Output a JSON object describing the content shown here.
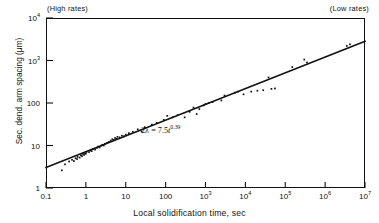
{
  "annotations": {
    "high_rates": "(High rates)",
    "low_rates": "(Low rates)",
    "equation_lhs": "2λ",
    "equation_eq": "=",
    "equation_coeff": "7.5",
    "equation_var": "t",
    "equation_exp": "0.39"
  },
  "chart_data": {
    "type": "scatter",
    "title": "",
    "xlabel": "Local solidification time, sec",
    "ylabel": "Sec. dend. arm spacing  (μm)",
    "xscale": "log",
    "yscale": "log",
    "xlim": [
      0.1,
      10000000
    ],
    "ylim": [
      1,
      10000
    ],
    "grid": false,
    "legend": null,
    "xticks": [
      0.1,
      1,
      10,
      100,
      1000,
      10000,
      100000,
      1000000,
      10000000
    ],
    "xtick_labels": [
      "0.1",
      "1",
      "10",
      "100",
      "10³",
      "10⁴",
      "10⁵",
      "10⁶",
      "10⁷"
    ],
    "yticks": [
      1,
      10,
      100,
      1000,
      10000
    ],
    "ytick_labels": [
      "1",
      "10",
      "100",
      "10³",
      "10⁴"
    ],
    "fit_line": {
      "label": "2λ = 7.5t^0.39",
      "coefficient": 7.5,
      "exponent": 0.39,
      "x_start": 0.1,
      "y_start": 3.05,
      "x_end": 10000000,
      "y_end": 2820
    },
    "points": [
      [
        0.25,
        2.6
      ],
      [
        0.3,
        3.6
      ],
      [
        0.38,
        4.2
      ],
      [
        0.45,
        4.6
      ],
      [
        0.5,
        4.3
      ],
      [
        0.55,
        5.0
      ],
      [
        0.6,
        4.8
      ],
      [
        0.62,
        5.4
      ],
      [
        0.7,
        5.2
      ],
      [
        0.75,
        5.9
      ],
      [
        0.8,
        5.6
      ],
      [
        0.85,
        6.3
      ],
      [
        0.9,
        6.0
      ],
      [
        0.95,
        6.6
      ],
      [
        1.0,
        6.4
      ],
      [
        1.05,
        7.1
      ],
      [
        1.2,
        7.0
      ],
      [
        1.3,
        7.6
      ],
      [
        1.4,
        7.4
      ],
      [
        1.5,
        8.2
      ],
      [
        1.7,
        8.0
      ],
      [
        1.9,
        8.8
      ],
      [
        2.0,
        9.4
      ],
      [
        2.2,
        9.0
      ],
      [
        2.4,
        9.9
      ],
      [
        2.6,
        10.4
      ],
      [
        2.8,
        10.0
      ],
      [
        3.0,
        11.0
      ],
      [
        3.4,
        11.6
      ],
      [
        3.8,
        12.2
      ],
      [
        4.2,
        13.0
      ],
      [
        4.6,
        14.0
      ],
      [
        5.0,
        13.5
      ],
      [
        5.4,
        15.0
      ],
      [
        5.8,
        14.4
      ],
      [
        6.2,
        16.0
      ],
      [
        7.0,
        15.5
      ],
      [
        8.0,
        17.0
      ],
      [
        9.0,
        16.5
      ],
      [
        10.0,
        18.0
      ],
      [
        12.0,
        19.5
      ],
      [
        15.0,
        21.0
      ],
      [
        20.0,
        24.0
      ],
      [
        25.0,
        21.5
      ],
      [
        30.0,
        27.0
      ],
      [
        45.0,
        31.0
      ],
      [
        60.0,
        34.0
      ],
      [
        90.0,
        40.0
      ],
      [
        110.0,
        50.0
      ],
      [
        150.0,
        46.0
      ],
      [
        200.0,
        52.0
      ],
      [
        300.0,
        46.0
      ],
      [
        400.0,
        62.0
      ],
      [
        500.0,
        78.0
      ],
      [
        600.0,
        55.0
      ],
      [
        700.0,
        72.0
      ],
      [
        900.0,
        88.0
      ],
      [
        1000.0,
        95.0
      ],
      [
        1200.0,
        100.0
      ],
      [
        1500.0,
        105.0
      ],
      [
        2500.0,
        115.0
      ],
      [
        3000.0,
        150.0
      ],
      [
        5500.0,
        175.0
      ],
      [
        6500.0,
        185.0
      ],
      [
        9000.0,
        160.0
      ],
      [
        14000.0,
        185.0
      ],
      [
        20000.0,
        195.0
      ],
      [
        28000.0,
        200.0
      ],
      [
        38000.0,
        400.0
      ],
      [
        45000.0,
        215.0
      ],
      [
        55000.0,
        220.0
      ],
      [
        150000.0,
        700.0
      ],
      [
        300000.0,
        1050.0
      ],
      [
        350000.0,
        900.0
      ],
      [
        3500000.0,
        2200.0
      ],
      [
        4200000.0,
        2400.0
      ]
    ]
  }
}
